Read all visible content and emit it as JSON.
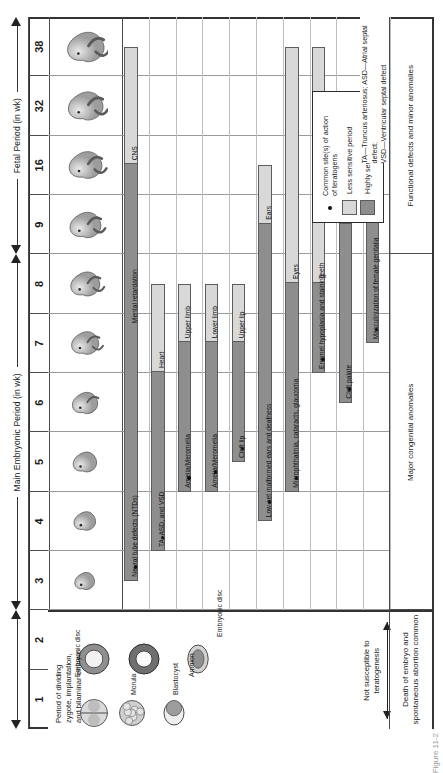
{
  "figure": {
    "caption": "Figure 11-2"
  },
  "colors": {
    "highly_sensitive": "#8e8e8e",
    "less_sensitive": "#d8d8d8",
    "grid": "#9a9a9a",
    "border": "#333333"
  },
  "periods": [
    {
      "id": "early",
      "label": "",
      "start_wk": 1,
      "end_wk": 2
    },
    {
      "id": "embryonic",
      "label": "Main Embryonic Period (in wk)",
      "start_wk": 3,
      "end_wk": 8
    },
    {
      "id": "fetal",
      "label": "Fetal Period (in wk)",
      "start_wk": 9,
      "end_wk": 38
    }
  ],
  "week_labels": [
    "1",
    "2",
    "3",
    "4",
    "5",
    "6",
    "7",
    "8",
    "9",
    "16",
    "32",
    "38"
  ],
  "stage1": {
    "title": "Period of dividing\nzygote, implantation,\nand bilaminar embryo",
    "labels": [
      "Morula",
      "Blastocyst",
      "Embryonic disc",
      "Amnion",
      "Embryonic disc"
    ],
    "note": "Not susceptible to\nteratogenesis"
  },
  "chart_data": {
    "type": "table",
    "xlabel": "Weeks of development",
    "week_ticks": [
      1,
      2,
      3,
      4,
      5,
      6,
      7,
      8,
      9,
      16,
      32,
      38
    ],
    "rows": [
      {
        "organ": "CNS",
        "anomaly": "Neural tube defects (NTDs)",
        "anomaly2": "Mental retardation",
        "highly_sensitive": [
          3,
          16
        ],
        "less_sensitive": [
          16,
          38
        ],
        "dot_wk": 3.2
      },
      {
        "organ": "Heart",
        "anomaly": "TA, ASD, and VSD",
        "highly_sensitive": [
          3.5,
          6.5
        ],
        "less_sensitive": [
          6.5,
          8
        ],
        "dot_wk": 3.7
      },
      {
        "organ": "Upper limb",
        "anomaly": "Amelia/Meromelia",
        "highly_sensitive": [
          4.5,
          7
        ],
        "less_sensitive": [
          7,
          8
        ],
        "dot_wk": 4.7
      },
      {
        "organ": "Lower limb",
        "anomaly": "Amelia/Meromelia",
        "highly_sensitive": [
          4.5,
          7
        ],
        "less_sensitive": [
          7,
          8
        ],
        "dot_wk": 4.8
      },
      {
        "organ": "Upper lip",
        "anomaly": "Cleft lip",
        "highly_sensitive": [
          5,
          7
        ],
        "less_sensitive": [
          7,
          8
        ],
        "dot_wk": 5.2
      },
      {
        "organ": "Ears",
        "anomaly": "Low-set malformed ears and deafness",
        "highly_sensitive": [
          4,
          9
        ],
        "less_sensitive": [
          9,
          16
        ],
        "dot_wk": 4.3
      },
      {
        "organ": "Eyes",
        "anomaly": "Microphthalmia, cataracts, glaucoma",
        "highly_sensitive": [
          4.5,
          8
        ],
        "less_sensitive": [
          8,
          38
        ],
        "dot_wk": 4.7
      },
      {
        "organ": "Teeth",
        "anomaly": "Enamel hypoplasia and staining",
        "highly_sensitive": [
          6.5,
          8
        ],
        "less_sensitive": [
          8,
          38
        ],
        "dot_wk": 6.7
      },
      {
        "organ": "Palate",
        "anomaly": "Cleft palate",
        "highly_sensitive": [
          6,
          9
        ],
        "less_sensitive": [
          9,
          9.8
        ],
        "dot_wk": 6.2
      },
      {
        "organ": "External genitalia",
        "anomaly": "Masculinization of female genitalia",
        "highly_sensitive": [
          7,
          9.6
        ],
        "less_sensitive": [
          9.6,
          38
        ],
        "dot_wk": 7.2
      }
    ]
  },
  "legend": {
    "dot_label": "Common site(s) of action\nof teratogens",
    "less_label": "Less sensitive period",
    "highly_label": "Highly sensitive period"
  },
  "footnote": "TA—Truncus arteriosus; ASD—Atrial septal defect;\nVSD—Ventricular septal defect",
  "summary": {
    "early": "Death of embryo and\nspontaneous abortion common",
    "embryonic": "Major congenital anomalies",
    "fetal": "Functional defects and minor anomalies"
  }
}
